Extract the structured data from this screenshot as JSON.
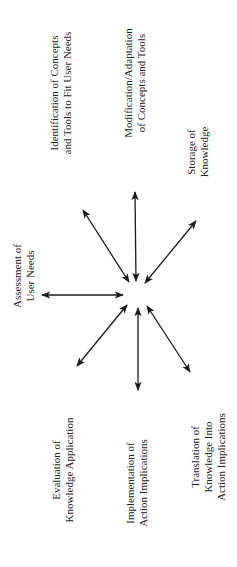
{
  "diagram": {
    "orientation": "rotated -90deg",
    "center_node": "",
    "nodes": [
      {
        "id": "identification",
        "lines": [
          "Identification of Concepts",
          "and Tools to Fit User Needs"
        ]
      },
      {
        "id": "modification",
        "lines": [
          "Modification/Adaptation",
          "of Concepts and Tools"
        ]
      },
      {
        "id": "storage",
        "lines": [
          "Storage of",
          "Knowledge"
        ]
      },
      {
        "id": "assessment",
        "lines": [
          "Assessment of",
          "User Needs"
        ]
      },
      {
        "id": "evaluation",
        "lines": [
          "Evaluation of",
          "Knowledge Application"
        ]
      },
      {
        "id": "implementation",
        "lines": [
          "Implementation of",
          "Action Implications"
        ]
      },
      {
        "id": "translation",
        "lines": [
          "Translation of",
          "Knowledge Into",
          "Action Implications"
        ]
      }
    ],
    "edges": [
      {
        "to": "assessment",
        "type": "bidirectional"
      },
      {
        "to": "identification",
        "type": "bidirectional"
      },
      {
        "to": "modification",
        "type": "bidirectional"
      },
      {
        "to": "storage",
        "type": "bidirectional"
      },
      {
        "to": "evaluation",
        "type": "bidirectional"
      },
      {
        "to": "implementation",
        "type": "bidirectional"
      },
      {
        "to": "translation",
        "type": "bidirectional"
      }
    ],
    "colors": {
      "line": "#1a1a1a",
      "text": "#222222",
      "background": "#ffffff"
    }
  }
}
